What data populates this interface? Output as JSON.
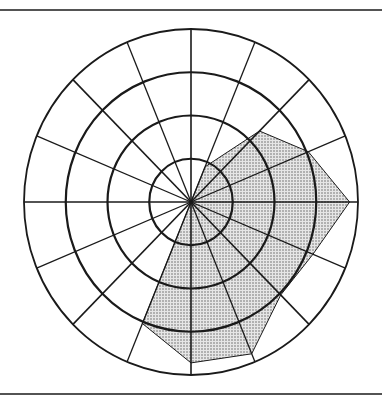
{
  "diagram": {
    "type": "polar-grid-with-shaded-polygon",
    "center": [
      191,
      202
    ],
    "outer_radius_x": 167,
    "outer_radius_y": 173,
    "rings": [
      0.25,
      0.5,
      0.75,
      1.0
    ],
    "spoke_count": 16,
    "spoke_step_deg": 22.5,
    "colors": {
      "line": "#1a1a1a",
      "fill": "#cfcfcf",
      "dot": "#555555",
      "background": "#ffffff"
    },
    "rules": {
      "top_y": 10,
      "bottom_y": 394
    },
    "shaded_polygon": {
      "includes_center": true,
      "vertices_polar": [
        {
          "angle_deg": 67.5,
          "r": 0.22
        },
        {
          "angle_deg": 45,
          "r": 0.58
        },
        {
          "angle_deg": 22.5,
          "r": 0.76
        },
        {
          "angle_deg": 0,
          "r": 0.95
        },
        {
          "angle_deg": -22.5,
          "r": 0.79
        },
        {
          "angle_deg": -45,
          "r": 0.76
        },
        {
          "angle_deg": -67.5,
          "r": 0.95
        },
        {
          "angle_deg": -90,
          "r": 0.93
        },
        {
          "angle_deg": -112.5,
          "r": 0.76
        }
      ]
    }
  }
}
